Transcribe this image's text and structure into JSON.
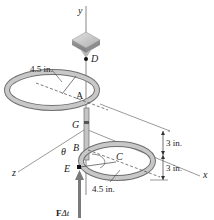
{
  "figure": {
    "axes": {
      "y": "y",
      "z": "z",
      "x": "x"
    },
    "points": {
      "A": "A",
      "B": "B",
      "C": "C",
      "D": "D",
      "E": "E",
      "G": "G"
    },
    "angle": "θ",
    "dimensions": {
      "top_radius": "4.5 in.",
      "bottom_radius": "4.5 in.",
      "upper_spacing": "3 in.",
      "lower_spacing": "3 in."
    },
    "impulse": {
      "F": "F",
      "dt": "Δt"
    },
    "colors": {
      "ring": "#b9b9b9",
      "ring_edge": "#6f6f6f",
      "block": "#a9a9a9",
      "arrow": "#7a7a7a",
      "line": "#555555"
    }
  }
}
